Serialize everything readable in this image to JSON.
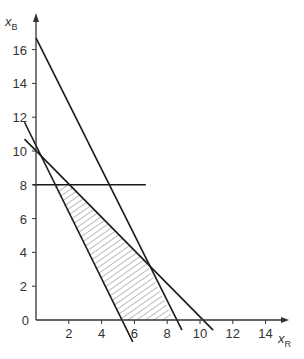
{
  "chart_data": {
    "type": "line",
    "title": "",
    "xlabel": "x_R",
    "ylabel": "x_B",
    "xlabel_main": "x",
    "xlabel_sub": "R",
    "ylabel_main": "x",
    "ylabel_sub": "B",
    "xlim": [
      0,
      15.3
    ],
    "ylim": [
      0,
      18
    ],
    "x_ticks": [
      2,
      4,
      6,
      8,
      10,
      12,
      14
    ],
    "y_ticks": [
      0,
      2,
      4,
      6,
      8,
      10,
      12,
      14,
      16
    ],
    "grid": false,
    "legend": null,
    "series": [
      {
        "name": "constraint-1",
        "x": [
          -0.7,
          5.9
        ],
        "y": [
          11.7,
          -1.3
        ]
      },
      {
        "name": "constraint-2",
        "x": [
          0,
          8.9
        ],
        "y": [
          16.7,
          -0.6
        ]
      },
      {
        "name": "constraint-3",
        "x": [
          -0.7,
          10.8
        ],
        "y": [
          10.7,
          -0.6
        ]
      },
      {
        "name": "constraint-4",
        "x": [
          -0.2,
          6.7
        ],
        "y": [
          8,
          8
        ]
      }
    ],
    "feasible_region": {
      "fill": "hatched",
      "vertices": [
        [
          1.06,
          8
        ],
        [
          2.04,
          8
        ],
        [
          6.64,
          3.5
        ],
        [
          8.4,
          0
        ],
        [
          5.3,
          0
        ]
      ]
    }
  },
  "colors": {
    "line": "#1a1a1a",
    "axis": "#333333",
    "hatch": "#555555",
    "background": "#ffffff"
  }
}
